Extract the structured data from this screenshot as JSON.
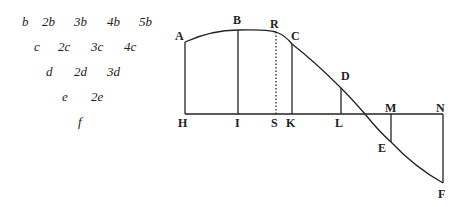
{
  "difference_table": {
    "rows": [
      {
        "items": [
          {
            "text": "b",
            "x": 22
          },
          {
            "text": "2b",
            "x": 42
          },
          {
            "text": "3b",
            "x": 74
          },
          {
            "text": "4b",
            "x": 107
          },
          {
            "text": "5b",
            "x": 139
          }
        ],
        "y": 14
      },
      {
        "items": [
          {
            "text": "c",
            "x": 34
          },
          {
            "text": "2c",
            "x": 58
          },
          {
            "text": "3c",
            "x": 91
          },
          {
            "text": "4c",
            "x": 124
          }
        ],
        "y": 39
      },
      {
        "items": [
          {
            "text": "d",
            "x": 46
          },
          {
            "text": "2d",
            "x": 74
          },
          {
            "text": "3d",
            "x": 107
          }
        ],
        "y": 64
      },
      {
        "items": [
          {
            "text": "e",
            "x": 62
          },
          {
            "text": "2e",
            "x": 91
          }
        ],
        "y": 89
      },
      {
        "items": [
          {
            "text": "f",
            "x": 78
          }
        ],
        "y": 114
      }
    ]
  },
  "figure": {
    "baseline": {
      "y": 114,
      "x1": 185,
      "x2": 443
    },
    "points": {
      "A": {
        "x": 185,
        "y": 42
      },
      "B": {
        "x": 238,
        "y": 30
      },
      "R": {
        "x": 276,
        "y": 32
      },
      "C": {
        "x": 292,
        "y": 44
      },
      "D": {
        "x": 341,
        "y": 88
      },
      "E": {
        "x": 391,
        "y": 142
      },
      "F": {
        "x": 443,
        "y": 183
      },
      "H": {
        "x": 185,
        "y": 114
      },
      "I": {
        "x": 238,
        "y": 114
      },
      "S": {
        "x": 276,
        "y": 114
      },
      "K": {
        "x": 292,
        "y": 114
      },
      "L": {
        "x": 341,
        "y": 114
      },
      "M": {
        "x": 391,
        "y": 114
      },
      "N": {
        "x": 443,
        "y": 114
      }
    },
    "labels": [
      {
        "text": "A",
        "x": 175,
        "y": 40
      },
      {
        "text": "B",
        "x": 233,
        "y": 24
      },
      {
        "text": "R",
        "x": 270,
        "y": 28
      },
      {
        "text": "C",
        "x": 291,
        "y": 40
      },
      {
        "text": "D",
        "x": 341,
        "y": 80
      },
      {
        "text": "E",
        "x": 378,
        "y": 152
      },
      {
        "text": "F",
        "x": 438,
        "y": 198
      },
      {
        "text": "H",
        "x": 178,
        "y": 127
      },
      {
        "text": "I",
        "x": 235,
        "y": 127
      },
      {
        "text": "S",
        "x": 271,
        "y": 127
      },
      {
        "text": "K",
        "x": 286,
        "y": 127
      },
      {
        "text": "L",
        "x": 335,
        "y": 127
      },
      {
        "text": "M",
        "x": 385,
        "y": 112
      },
      {
        "text": "N",
        "x": 436,
        "y": 112
      }
    ]
  }
}
